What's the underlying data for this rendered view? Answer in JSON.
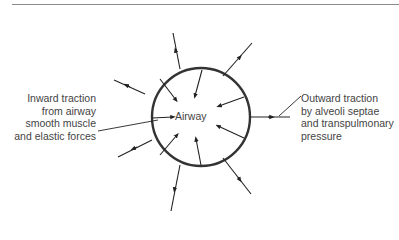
{
  "diagram": {
    "center_label": "Airway",
    "left_annotation": [
      "Inward traction",
      "from airway",
      "smooth muscle",
      "and elastic forces"
    ],
    "right_annotation": [
      "Outward traction",
      "by alveoli septae",
      "and transpulmonary",
      "pressure"
    ],
    "colors": {
      "circle": "#333333",
      "arrows": "#222222",
      "text": "#444444",
      "rule": "#8a8a8a"
    }
  }
}
